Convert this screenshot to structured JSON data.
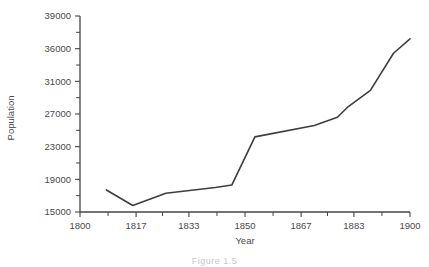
{
  "figure": {
    "caption": "Figure 1.5"
  },
  "chart_data": {
    "type": "line",
    "title": "",
    "xlabel": "Year",
    "ylabel": "Population",
    "grid": false,
    "legend": null,
    "xlim": [
      1800,
      1900
    ],
    "ylim": [
      15000,
      39000
    ],
    "xticks": [
      1800,
      1817,
      1833,
      1850,
      1867,
      1883,
      1900
    ],
    "xtick_labels": [
      "1800",
      "1817",
      "1833",
      "1850",
      "1867",
      "1883",
      "1900"
    ],
    "yticks": [
      15000,
      19000,
      23000,
      27000,
      31000,
      36000,
      39000
    ],
    "ytick_labels": [
      "15000",
      "19000",
      "23000",
      "27000",
      "31000",
      "36000",
      "39000"
    ],
    "y_minor_ticks_between": 1,
    "series": [
      {
        "name": "Population",
        "color": "#3d3d3d",
        "x": [
          1808,
          1816,
          1826,
          1841,
          1846,
          1853,
          1871,
          1878,
          1881,
          1888,
          1895,
          1900
        ],
        "y": [
          17700,
          15800,
          17300,
          18000,
          18300,
          24200,
          25600,
          26600,
          27800,
          29900,
          35300,
          36900
        ]
      }
    ]
  }
}
